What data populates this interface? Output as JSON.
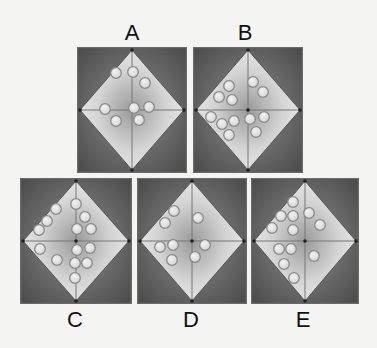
{
  "puzzle": {
    "colors": {
      "background": "#f4f4f2",
      "frame_dark": "#4a4a4a",
      "frame_edge": "#6a6a6a",
      "diamond_light": "#e8e8e8",
      "diamond_mid": "#9a9a9a",
      "ball_fill": "#d6d6d6",
      "ball_stroke": "#8a8a8a",
      "line": "#777777",
      "label": "#111111"
    },
    "panels": [
      {
        "id": "A",
        "label": "A",
        "box": {
          "x": 77,
          "y": 47,
          "w": 110,
          "h": 126
        },
        "label_pos": {
          "x": 112,
          "y": 21
        },
        "balls": [
          [
            39,
            26
          ],
          [
            56,
            25
          ],
          [
            68,
            36
          ],
          [
            28,
            62
          ],
          [
            39,
            74
          ],
          [
            57,
            61
          ],
          [
            72,
            60
          ],
          [
            62,
            73
          ]
        ]
      },
      {
        "id": "B",
        "label": "B",
        "box": {
          "x": 193,
          "y": 47,
          "w": 110,
          "h": 126
        },
        "label_pos": {
          "x": 225,
          "y": 21
        },
        "balls": [
          [
            36,
            39
          ],
          [
            26,
            50
          ],
          [
            39,
            53
          ],
          [
            60,
            35
          ],
          [
            70,
            45
          ],
          [
            18,
            70
          ],
          [
            29,
            77
          ],
          [
            41,
            74
          ],
          [
            36,
            88
          ],
          [
            57,
            72
          ],
          [
            71,
            70
          ],
          [
            63,
            85
          ]
        ]
      },
      {
        "id": "C",
        "label": "C",
        "box": {
          "x": 20,
          "y": 178,
          "w": 112,
          "h": 126
        },
        "label_pos": {
          "x": 55,
          "y": 308
        },
        "balls": [
          [
            36,
            31
          ],
          [
            27,
            43
          ],
          [
            19,
            52
          ],
          [
            56,
            26
          ],
          [
            65,
            39
          ],
          [
            57,
            51
          ],
          [
            71,
            51
          ],
          [
            20,
            71
          ],
          [
            37,
            82
          ],
          [
            57,
            72
          ],
          [
            70,
            70
          ],
          [
            55,
            85
          ],
          [
            67,
            85
          ],
          [
            55,
            100
          ]
        ]
      },
      {
        "id": "D",
        "label": "D",
        "box": {
          "x": 137,
          "y": 178,
          "w": 110,
          "h": 126
        },
        "label_pos": {
          "x": 171,
          "y": 308
        },
        "balls": [
          [
            37,
            33
          ],
          [
            28,
            45
          ],
          [
            61,
            40
          ],
          [
            23,
            69
          ],
          [
            36,
            67
          ],
          [
            35,
            82
          ],
          [
            68,
            67
          ],
          [
            58,
            79
          ]
        ]
      },
      {
        "id": "E",
        "label": "E",
        "box": {
          "x": 251,
          "y": 178,
          "w": 108,
          "h": 126
        },
        "label_pos": {
          "x": 283,
          "y": 308
        },
        "balls": [
          [
            42,
            24
          ],
          [
            30,
            38
          ],
          [
            42,
            38
          ],
          [
            21,
            50
          ],
          [
            42,
            52
          ],
          [
            58,
            35
          ],
          [
            69,
            47
          ],
          [
            28,
            71
          ],
          [
            40,
            71
          ],
          [
            33,
            86
          ],
          [
            43,
            100
          ],
          [
            63,
            78
          ]
        ]
      }
    ]
  }
}
